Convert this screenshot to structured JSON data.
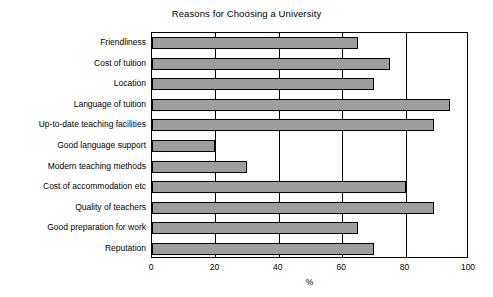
{
  "chart_data": {
    "type": "bar",
    "orientation": "horizontal",
    "title": "Reasons for Choosing a University",
    "xlabel": "%",
    "ylabel": "",
    "xlim": [
      0,
      100
    ],
    "xticks": [
      "0",
      "20",
      "40",
      "60",
      "80",
      "100"
    ],
    "grid": true,
    "grid_axis": "x",
    "legend": false,
    "bar_color": "#9e9e9e",
    "bar_edge_color": "#000000",
    "categories": [
      "Friendliness",
      "Cost of tuition",
      "Location",
      "Language of tuition",
      "Up-to-date teaching facilities",
      "Good language support",
      "Modern teaching methods",
      "Cost of accommodation etc",
      "Quality of teachers",
      "Good preparation for work",
      "Reputation"
    ],
    "values": [
      65,
      75,
      70,
      94,
      89,
      20,
      30,
      80,
      89,
      65,
      70
    ]
  }
}
